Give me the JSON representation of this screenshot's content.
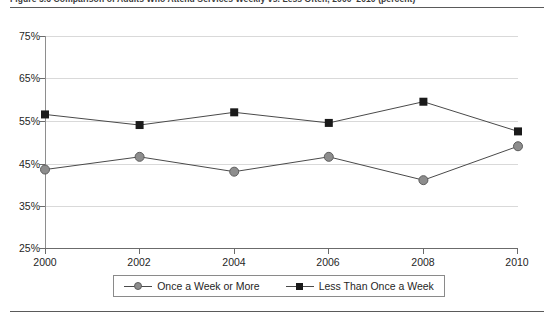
{
  "figure": {
    "title": "Figure 5.6   Comparison of Adults Who Attend Services Weekly vs. Less Often, 2000–2010 (percent)",
    "rules": {
      "top": true,
      "bottom": true
    }
  },
  "chart_data": {
    "type": "line",
    "title": "",
    "xlabel": "",
    "ylabel": "",
    "x": [
      2000,
      2002,
      2004,
      2006,
      2008,
      2010
    ],
    "categories": [
      "2000",
      "2002",
      "2004",
      "2006",
      "2008",
      "2010"
    ],
    "xlim": [
      2000,
      2010
    ],
    "ylim": [
      25,
      75
    ],
    "yticks": [
      25,
      35,
      45,
      55,
      65,
      75
    ],
    "ytick_labels": [
      "25%",
      "35%",
      "45%",
      "55%",
      "65%",
      "75%"
    ],
    "xtick_labels": [
      "2000",
      "2002",
      "2004",
      "2006",
      "2008",
      "2010"
    ],
    "grid": "horizontal",
    "legend_position": "bottom",
    "series": [
      {
        "name": "Once a Week or More",
        "marker": "circle",
        "color": "#8d8d8d",
        "line_color": "#4a4a4a",
        "values": [
          43.5,
          46.5,
          43.0,
          46.5,
          41.0,
          49.0
        ]
      },
      {
        "name": "Less Than Once a Week",
        "marker": "square",
        "color": "#1a1a1a",
        "line_color": "#4a4a4a",
        "values": [
          56.5,
          54.0,
          57.0,
          54.5,
          59.5,
          52.5
        ]
      }
    ]
  },
  "legend": {
    "items": [
      {
        "label": "Once a Week or More",
        "marker": "circle-marker-icon"
      },
      {
        "label": "Less Than Once a Week",
        "marker": "square-marker-icon"
      }
    ]
  },
  "axis": {
    "y_labels": [
      "75%",
      "65%",
      "55%",
      "45%",
      "35%",
      "25%"
    ],
    "x_labels": [
      "2000",
      "2002",
      "2004",
      "2006",
      "2008",
      "2010"
    ]
  }
}
